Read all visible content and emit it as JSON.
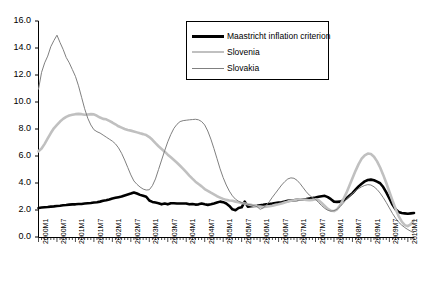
{
  "chart_data": {
    "type": "line",
    "title": "",
    "subtitle": "",
    "xlabel": "",
    "ylabel": "",
    "ylim": [
      0.0,
      16.0
    ],
    "yticks": [
      "0.0",
      "2.0",
      "4.0",
      "6.0",
      "8.0",
      "10.0",
      "12.0",
      "14.0",
      "16.0"
    ],
    "ytick_values": [
      0,
      2,
      4,
      6,
      8,
      10,
      12,
      14,
      16
    ],
    "grid": false,
    "legend_position": "top-right",
    "x": [
      "2000M1",
      "2000M2",
      "2000M3",
      "2000M4",
      "2000M5",
      "2000M6",
      "2000M7",
      "2000M8",
      "2000M9",
      "2000M10",
      "2000M11",
      "2000M12",
      "2001M1",
      "2001M2",
      "2001M3",
      "2001M4",
      "2001M5",
      "2001M6",
      "2001M7",
      "2001M8",
      "2001M9",
      "2001M10",
      "2001M11",
      "2001M12",
      "2002M1",
      "2002M2",
      "2002M3",
      "2002M4",
      "2002M5",
      "2002M6",
      "2002M7",
      "2002M8",
      "2002M9",
      "2002M10",
      "2002M11",
      "2002M12",
      "2003M1",
      "2003M2",
      "2003M3",
      "2003M4",
      "2003M5",
      "2003M6",
      "2003M7",
      "2003M8",
      "2003M9",
      "2003M10",
      "2003M11",
      "2003M12",
      "2004M1",
      "2004M2",
      "2004M3",
      "2004M4",
      "2004M5",
      "2004M6",
      "2004M7",
      "2004M8",
      "2004M9",
      "2004M10",
      "2004M11",
      "2004M12",
      "2005M1",
      "2005M2",
      "2005M3",
      "2005M4",
      "2005M5",
      "2005M6",
      "2005M7",
      "2005M8",
      "2005M9",
      "2005M10",
      "2005M11",
      "2005M12",
      "2006M1",
      "2006M2",
      "2006M3",
      "2006M4",
      "2006M5",
      "2006M6",
      "2006M7",
      "2006M8",
      "2006M9",
      "2006M10",
      "2006M11",
      "2006M12",
      "2007M1",
      "2007M2",
      "2007M3",
      "2007M4",
      "2007M5",
      "2007M6",
      "2007M7",
      "2007M8",
      "2007M9",
      "2007M10",
      "2007M11",
      "2007M12",
      "2008M1",
      "2008M2",
      "2008M3",
      "2008M4",
      "2008M5",
      "2008M6",
      "2008M7",
      "2008M8",
      "2008M9",
      "2008M10",
      "2008M11",
      "2008M12",
      "2009M1",
      "2009M2",
      "2009M3",
      "2009M4",
      "2009M5",
      "2009M6",
      "2009M7",
      "2009M8",
      "2009M9",
      "2009M10",
      "2009M11",
      "2009M12",
      "2010M1",
      "2010M2",
      "2010M3"
    ],
    "xtick_labels": [
      "2000M1",
      "2000M7",
      "2001M1",
      "2001M7",
      "2002M1",
      "2002M7",
      "2003M1",
      "2003M7",
      "2004M1",
      "2004M7",
      "2005M1",
      "2005M7",
      "2006M1",
      "2006M7",
      "2007M1",
      "2007M7",
      "2008M1",
      "2008M7",
      "2009M1",
      "2009M7",
      "2010M1"
    ],
    "xtick_indices": [
      0,
      6,
      12,
      18,
      24,
      30,
      36,
      42,
      48,
      54,
      60,
      66,
      72,
      78,
      84,
      90,
      96,
      102,
      108,
      114,
      120
    ],
    "series": [
      {
        "name": "Maastricht inflation criterion",
        "color": "#000000",
        "width": 2.6,
        "values": [
          2.15,
          2.18,
          2.2,
          2.22,
          2.25,
          2.27,
          2.3,
          2.32,
          2.35,
          2.37,
          2.4,
          2.42,
          2.42,
          2.45,
          2.45,
          2.48,
          2.5,
          2.52,
          2.55,
          2.58,
          2.62,
          2.68,
          2.72,
          2.78,
          2.85,
          2.9,
          2.95,
          3.0,
          3.08,
          3.15,
          3.22,
          3.3,
          3.22,
          3.12,
          3.05,
          2.98,
          2.7,
          2.6,
          2.55,
          2.5,
          2.42,
          2.48,
          2.42,
          2.5,
          2.5,
          2.48,
          2.48,
          2.48,
          2.48,
          2.42,
          2.45,
          2.4,
          2.42,
          2.48,
          2.42,
          2.38,
          2.42,
          2.48,
          2.55,
          2.62,
          2.58,
          2.48,
          2.3,
          2.05,
          1.98,
          2.15,
          2.2,
          2.62,
          2.25,
          2.28,
          2.3,
          2.32,
          2.35,
          2.38,
          2.42,
          2.45,
          2.48,
          2.52,
          2.55,
          2.58,
          2.62,
          2.68,
          2.7,
          2.72,
          2.75,
          2.78,
          2.8,
          2.82,
          2.85,
          2.88,
          2.92,
          2.98,
          3.02,
          3.05,
          2.95,
          2.8,
          2.62,
          2.6,
          2.62,
          2.7,
          2.85,
          3.05,
          3.25,
          3.5,
          3.75,
          3.95,
          4.12,
          4.22,
          4.25,
          4.2,
          4.1,
          3.98,
          3.7,
          3.3,
          2.85,
          2.4,
          2.05,
          1.85,
          1.78,
          1.75,
          1.72,
          1.75,
          1.78
        ]
      },
      {
        "name": "Slovenia",
        "color": "#c0c0c0",
        "width": 2.6,
        "values": [
          6.35,
          6.55,
          6.9,
          7.3,
          7.7,
          8.05,
          8.3,
          8.55,
          8.75,
          8.9,
          9.0,
          9.05,
          9.1,
          9.12,
          9.1,
          9.05,
          9.08,
          9.1,
          9.08,
          8.98,
          8.85,
          8.75,
          8.72,
          8.6,
          8.48,
          8.35,
          8.2,
          8.1,
          8.0,
          7.92,
          7.88,
          7.82,
          7.75,
          7.68,
          7.62,
          7.55,
          7.4,
          7.2,
          6.95,
          6.72,
          6.52,
          6.32,
          6.1,
          5.9,
          5.7,
          5.5,
          5.28,
          5.05,
          4.8,
          4.55,
          4.32,
          4.1,
          3.92,
          3.75,
          3.55,
          3.42,
          3.28,
          3.15,
          3.02,
          2.92,
          2.82,
          2.75,
          2.7,
          2.68,
          2.62,
          2.58,
          2.52,
          2.48,
          2.42,
          2.38,
          2.32,
          2.28,
          2.25,
          2.22,
          2.25,
          2.28,
          2.32,
          2.38,
          2.42,
          2.48,
          2.55,
          2.62,
          2.68,
          2.72,
          2.78,
          2.8,
          2.78,
          2.75,
          2.72,
          2.75,
          2.8,
          2.72,
          2.52,
          2.3,
          2.08,
          1.95,
          1.92,
          2.05,
          2.35,
          2.78,
          3.25,
          3.8,
          4.35,
          4.9,
          5.4,
          5.8,
          6.05,
          6.18,
          6.15,
          5.95,
          5.6,
          5.15,
          4.6,
          4.0,
          3.35,
          2.7,
          2.1,
          1.55,
          1.15,
          0.88,
          0.8,
          0.95,
          1.25
        ]
      },
      {
        "name": "Slovakia",
        "color": "#808080",
        "width": 1.0,
        "values": [
          10.95,
          12.2,
          12.9,
          13.4,
          14.1,
          14.55,
          14.95,
          14.4,
          13.9,
          13.3,
          12.9,
          12.4,
          11.9,
          11.2,
          10.35,
          9.5,
          8.8,
          8.3,
          7.95,
          7.8,
          7.7,
          7.55,
          7.4,
          7.25,
          7.1,
          6.9,
          6.6,
          6.2,
          5.7,
          5.15,
          4.6,
          4.15,
          3.9,
          3.7,
          3.55,
          3.48,
          3.5,
          3.8,
          4.3,
          5.0,
          5.7,
          6.4,
          7.05,
          7.6,
          8.05,
          8.35,
          8.55,
          8.62,
          8.65,
          8.68,
          8.7,
          8.72,
          8.68,
          8.55,
          8.3,
          7.85,
          7.25,
          6.55,
          5.8,
          5.05,
          4.4,
          3.85,
          3.4,
          3.05,
          2.8,
          2.65,
          2.55,
          2.48,
          2.42,
          2.38,
          2.32,
          2.25,
          2.05,
          2.15,
          2.35,
          2.62,
          2.95,
          3.25,
          3.55,
          3.85,
          4.1,
          4.3,
          4.38,
          4.35,
          4.2,
          3.95,
          3.65,
          3.35,
          3.1,
          2.92,
          2.8,
          2.55,
          2.32,
          2.12,
          1.98,
          1.92,
          1.95,
          2.05,
          2.25,
          2.5,
          2.78,
          3.02,
          3.22,
          3.42,
          3.58,
          3.72,
          3.82,
          3.88,
          3.85,
          3.72,
          3.52,
          3.25,
          2.92,
          2.55,
          2.15,
          1.75,
          1.4,
          1.1,
          0.88,
          0.7,
          0.55,
          0.42,
          0.3
        ]
      }
    ]
  },
  "legend": {
    "items": [
      {
        "label": "Maastricht inflation criterion",
        "color": "#000000",
        "thickness": "3px"
      },
      {
        "label": "Slovenia",
        "color": "#c0c0c0",
        "thickness": "2px"
      },
      {
        "label": "Slovakia",
        "color": "#808080",
        "thickness": "1px"
      }
    ]
  },
  "axis": {
    "color": "#000000"
  }
}
